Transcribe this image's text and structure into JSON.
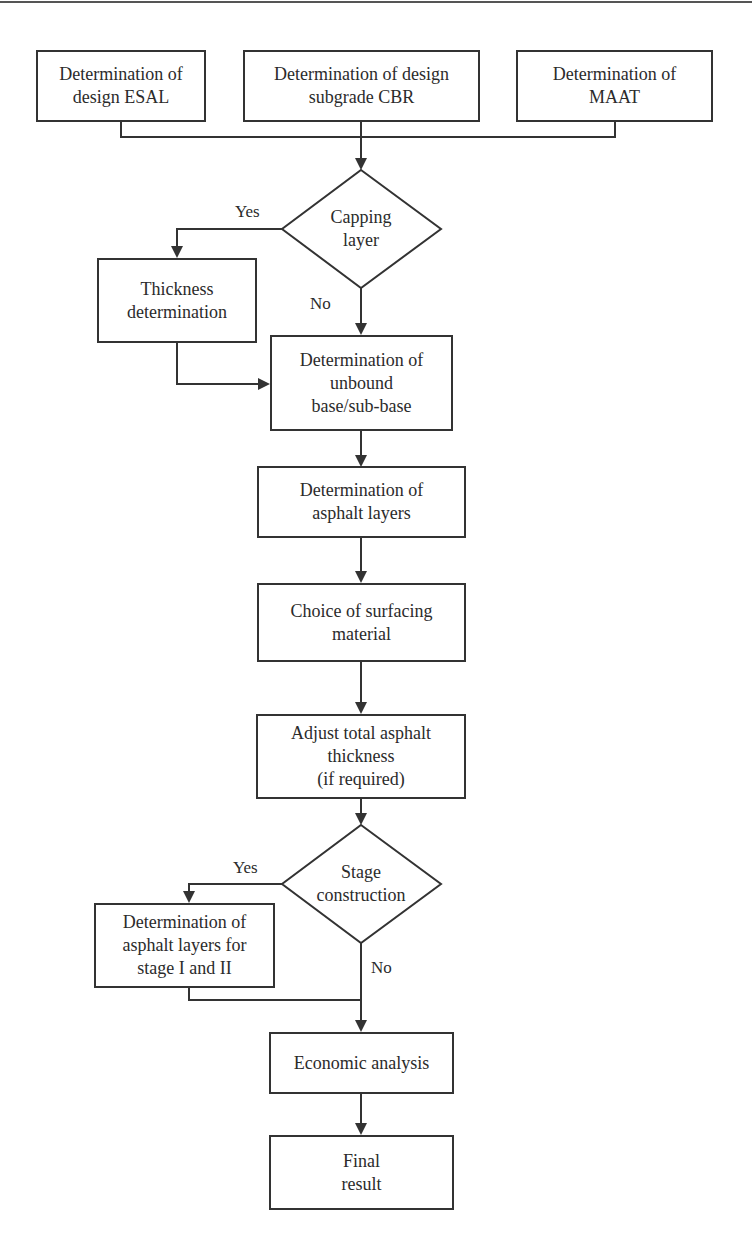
{
  "diagram": {
    "type": "flowchart",
    "nodes": {
      "esal": {
        "kind": "process",
        "label": "Determination of\ndesign ESAL"
      },
      "cbr": {
        "kind": "process",
        "label": "Determination of design\nsubgrade CBR"
      },
      "maat": {
        "kind": "process",
        "label": "Determination of\nMAAT"
      },
      "capping": {
        "kind": "decision",
        "label": "Capping\nlayer"
      },
      "thickness": {
        "kind": "process",
        "label": "Thickness\ndetermination"
      },
      "base": {
        "kind": "process",
        "label": "Determination of\nunbound\nbase/sub-base"
      },
      "asphalt": {
        "kind": "process",
        "label": "Determination of\nasphalt layers"
      },
      "surfacing": {
        "kind": "process",
        "label": "Choice of surfacing\nmaterial"
      },
      "adjust": {
        "kind": "process",
        "label": "Adjust total asphalt\nthickness\n(if required)"
      },
      "stage": {
        "kind": "decision",
        "label": "Stage\nconstruction"
      },
      "stage_layers": {
        "kind": "process",
        "label": "Determination of\nasphalt layers for\nstage I and II"
      },
      "economic": {
        "kind": "process",
        "label": "Economic analysis"
      },
      "final": {
        "kind": "terminal",
        "label": "Final\nresult"
      }
    },
    "edge_labels": {
      "capping_yes": "Yes",
      "capping_no": "No",
      "stage_yes": "Yes",
      "stage_no": "No"
    },
    "edges": [
      {
        "from": "esal",
        "to": "capping"
      },
      {
        "from": "cbr",
        "to": "capping"
      },
      {
        "from": "maat",
        "to": "capping"
      },
      {
        "from": "capping",
        "to": "thickness",
        "label": "Yes"
      },
      {
        "from": "capping",
        "to": "base",
        "label": "No"
      },
      {
        "from": "thickness",
        "to": "base"
      },
      {
        "from": "base",
        "to": "asphalt"
      },
      {
        "from": "asphalt",
        "to": "surfacing"
      },
      {
        "from": "surfacing",
        "to": "adjust"
      },
      {
        "from": "adjust",
        "to": "stage"
      },
      {
        "from": "stage",
        "to": "stage_layers",
        "label": "Yes"
      },
      {
        "from": "stage",
        "to": "economic",
        "label": "No"
      },
      {
        "from": "stage_layers",
        "to": "economic"
      },
      {
        "from": "economic",
        "to": "final"
      }
    ],
    "colors": {
      "stroke": "#333333",
      "text": "#2b2b2b",
      "background": "#ffffff"
    }
  }
}
